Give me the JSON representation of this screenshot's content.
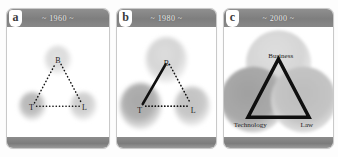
{
  "figure": {
    "panels": [
      {
        "letter": "a",
        "title": "~ 1960 ~",
        "nodes": [
          {
            "id": "business",
            "label": "B",
            "x": 50,
            "y": 30
          },
          {
            "id": "technology",
            "label": "T",
            "x": 25,
            "y": 72
          },
          {
            "id": "law",
            "label": "L",
            "x": 75,
            "y": 72
          }
        ],
        "edges": [
          {
            "from": "technology",
            "to": "business",
            "style": "dotted"
          },
          {
            "from": "business",
            "to": "law",
            "style": "dotted"
          },
          {
            "from": "technology",
            "to": "law",
            "style": "dotted"
          }
        ],
        "circle_radius": 13,
        "overlap": "none",
        "label_size": "small"
      },
      {
        "letter": "b",
        "title": "~ 1980 ~",
        "nodes": [
          {
            "id": "business",
            "label": "B",
            "x": 50,
            "y": 30
          },
          {
            "id": "technology",
            "label": "T",
            "x": 24,
            "y": 72
          },
          {
            "id": "law",
            "label": "L",
            "x": 76,
            "y": 72
          }
        ],
        "edges": [
          {
            "from": "technology",
            "to": "business",
            "style": "solid"
          },
          {
            "from": "business",
            "to": "law",
            "style": "dotted"
          },
          {
            "from": "technology",
            "to": "law",
            "style": "dotted"
          }
        ],
        "circle_radius": 21,
        "overlap": "partial",
        "label_size": "small"
      },
      {
        "letter": "c",
        "title": "~ 2000 ~",
        "nodes": [
          {
            "id": "business",
            "label": "Business",
            "x": 50,
            "y": 30
          },
          {
            "id": "technology",
            "label": "Technology",
            "x": 25,
            "y": 70
          },
          {
            "id": "law",
            "label": "Law",
            "x": 74,
            "y": 70
          }
        ],
        "edges": [
          {
            "from": "technology",
            "to": "business",
            "style": "solid"
          },
          {
            "from": "business",
            "to": "law",
            "style": "solid"
          },
          {
            "from": "technology",
            "to": "law",
            "style": "solid"
          }
        ],
        "circle_radius": 30,
        "overlap": "heavy",
        "label_size": "large"
      }
    ]
  },
  "colors": {
    "header_band": "#7e7e7e",
    "footer_band": "#7c7c7c",
    "panel_border": "#c9c9c9",
    "panel_body": "#ffffff",
    "letter_badge": "#ffffff",
    "title_text": "#f2f2f2",
    "label_text": "#1c1c1c",
    "edge_line": "#111111",
    "circle_business": "#d9d9d9",
    "circle_technology": "#a6a6a6",
    "circle_law": "#c4c4c4"
  }
}
